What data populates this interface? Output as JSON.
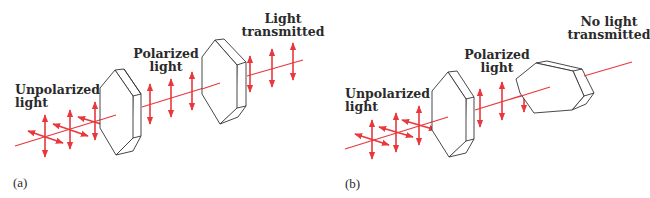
{
  "figure": {
    "colors": {
      "beam": "#e8383d",
      "polarizer_stroke": "#333333",
      "polarizer_fill": "#ffffff",
      "text": "#2a2a2a"
    },
    "panels": [
      {
        "id": "a",
        "panel_label": "(a)",
        "labels": {
          "unpolarized": [
            "Unpolarized",
            "light"
          ],
          "polarized": [
            "Polarized",
            "light"
          ],
          "output": [
            "Light",
            "transmitted"
          ]
        },
        "analyzer_orientation": "aligned",
        "light_transmitted": true
      },
      {
        "id": "b",
        "panel_label": "(b)",
        "labels": {
          "unpolarized": [
            "Unpolarized",
            "light"
          ],
          "polarized": [
            "Polarized",
            "light"
          ],
          "output": [
            "No light",
            "transmitted"
          ]
        },
        "analyzer_orientation": "crossed (rotated 90°)",
        "light_transmitted": false
      }
    ]
  }
}
